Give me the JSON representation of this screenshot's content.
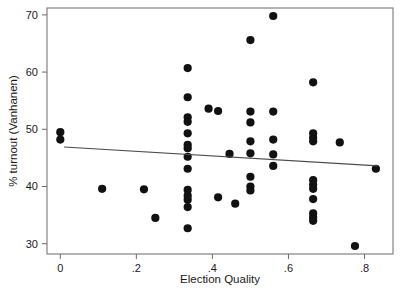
{
  "chart_data": {
    "type": "scatter",
    "title": "",
    "xlabel": "Election Quality",
    "ylabel": "% turnout (Vanhanen)",
    "xlim": [
      -0.035,
      0.875
    ],
    "ylim": [
      28.2,
      71.2
    ],
    "grid": false,
    "legend": null,
    "xticks": [
      0,
      0.2,
      0.4,
      0.6,
      0.8
    ],
    "xtick_labels": [
      "0",
      ".2",
      ".4",
      ".6",
      ".8"
    ],
    "yticks": [
      30,
      40,
      50,
      60,
      70
    ],
    "ytick_labels": [
      "30",
      "40",
      "50",
      "60",
      "70"
    ],
    "marker_color": "#111111",
    "marker_size": 4.1,
    "points": [
      {
        "x": 0.0,
        "y": 49.5
      },
      {
        "x": 0.0,
        "y": 48.2
      },
      {
        "x": 0.11,
        "y": 39.6
      },
      {
        "x": 0.22,
        "y": 39.5
      },
      {
        "x": 0.25,
        "y": 34.5
      },
      {
        "x": 0.335,
        "y": 60.7
      },
      {
        "x": 0.335,
        "y": 55.6
      },
      {
        "x": 0.335,
        "y": 52.1
      },
      {
        "x": 0.335,
        "y": 51.3
      },
      {
        "x": 0.335,
        "y": 49.3
      },
      {
        "x": 0.335,
        "y": 47.3
      },
      {
        "x": 0.335,
        "y": 46.7
      },
      {
        "x": 0.335,
        "y": 45.2
      },
      {
        "x": 0.335,
        "y": 43.1
      },
      {
        "x": 0.335,
        "y": 39.4
      },
      {
        "x": 0.335,
        "y": 38.4
      },
      {
        "x": 0.335,
        "y": 37.7
      },
      {
        "x": 0.335,
        "y": 36.4
      },
      {
        "x": 0.335,
        "y": 32.7
      },
      {
        "x": 0.39,
        "y": 53.6
      },
      {
        "x": 0.415,
        "y": 53.2
      },
      {
        "x": 0.415,
        "y": 38.1
      },
      {
        "x": 0.445,
        "y": 45.7
      },
      {
        "x": 0.46,
        "y": 37.0
      },
      {
        "x": 0.5,
        "y": 65.6
      },
      {
        "x": 0.5,
        "y": 53.1
      },
      {
        "x": 0.5,
        "y": 51.2
      },
      {
        "x": 0.5,
        "y": 47.9
      },
      {
        "x": 0.5,
        "y": 45.8
      },
      {
        "x": 0.5,
        "y": 41.7
      },
      {
        "x": 0.5,
        "y": 40.0
      },
      {
        "x": 0.5,
        "y": 39.3
      },
      {
        "x": 0.56,
        "y": 69.8
      },
      {
        "x": 0.56,
        "y": 53.1
      },
      {
        "x": 0.56,
        "y": 48.2
      },
      {
        "x": 0.56,
        "y": 45.6
      },
      {
        "x": 0.56,
        "y": 43.6
      },
      {
        "x": 0.665,
        "y": 58.2
      },
      {
        "x": 0.665,
        "y": 49.3
      },
      {
        "x": 0.665,
        "y": 48.5
      },
      {
        "x": 0.665,
        "y": 47.9
      },
      {
        "x": 0.665,
        "y": 41.1
      },
      {
        "x": 0.665,
        "y": 40.3
      },
      {
        "x": 0.665,
        "y": 39.6
      },
      {
        "x": 0.665,
        "y": 37.8
      },
      {
        "x": 0.665,
        "y": 35.3
      },
      {
        "x": 0.665,
        "y": 34.6
      },
      {
        "x": 0.665,
        "y": 34.0
      },
      {
        "x": 0.735,
        "y": 47.7
      },
      {
        "x": 0.775,
        "y": 29.6
      },
      {
        "x": 0.83,
        "y": 43.1
      }
    ],
    "fit_line": {
      "type": "linear",
      "x_start": 0.01,
      "y_start": 46.9,
      "x_end": 0.835,
      "y_end": 43.6,
      "color": "#4a4a4a"
    }
  },
  "plot_area": {
    "left": 47,
    "top": 8,
    "right": 393,
    "bottom": 254
  }
}
